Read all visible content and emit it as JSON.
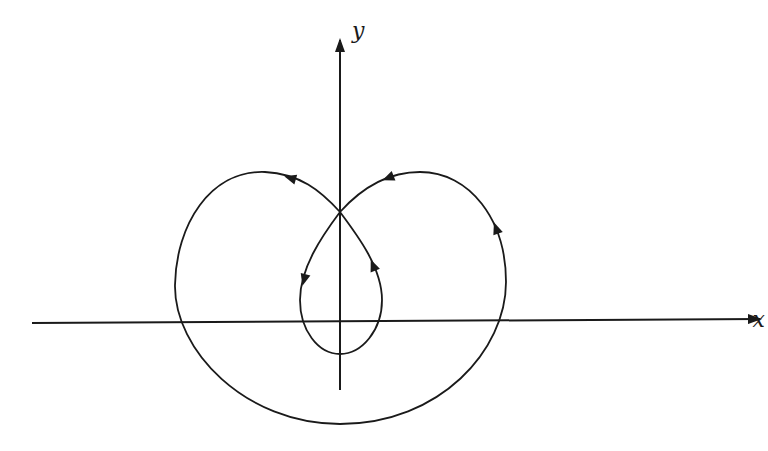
{
  "figure": {
    "type": "limacon-trajectory",
    "axes": {
      "x_label": "x",
      "y_label": "y"
    },
    "colors": {
      "stroke": "#1a1a1a",
      "background": "#ffffff"
    },
    "direction_arrows": [
      {
        "position": "outer-left-lobe-top",
        "direction": "left"
      },
      {
        "position": "outer-right-lobe-top",
        "direction": "left"
      },
      {
        "position": "outer-right-side",
        "direction": "up"
      },
      {
        "position": "inner-loop-right",
        "direction": "up"
      },
      {
        "position": "inner-loop-left",
        "direction": "down"
      }
    ]
  }
}
